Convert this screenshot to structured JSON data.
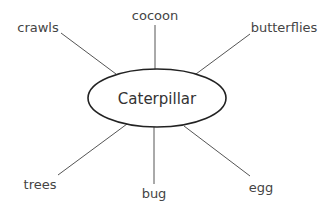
{
  "diagram": {
    "type": "concept-web",
    "center": {
      "label": "Caterpillar"
    },
    "nodes": [
      {
        "label": "cocoon"
      },
      {
        "label": "crawls"
      },
      {
        "label": "butterflies"
      },
      {
        "label": "trees"
      },
      {
        "label": "bug"
      },
      {
        "label": "egg"
      }
    ]
  }
}
